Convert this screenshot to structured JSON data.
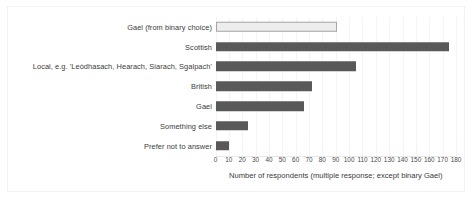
{
  "chart_data": {
    "type": "bar",
    "orientation": "horizontal",
    "title": "",
    "xlabel": "Number of respondents (multiple response; except binary Gael)",
    "ylabel": "",
    "xlim": [
      0,
      180
    ],
    "xticks": [
      0,
      10,
      20,
      30,
      40,
      50,
      60,
      70,
      80,
      90,
      100,
      110,
      120,
      130,
      140,
      150,
      160,
      170,
      180
    ],
    "grid": true,
    "legend": "none",
    "categories": [
      "Gael (from binary choice)",
      "Scottish",
      "Local, e.g. 'Leòdhasach, Hearach, Siarach, Sgalpach'",
      "British",
      "Gael",
      "Something else",
      "Prefer not to answer"
    ],
    "values": [
      91,
      175,
      105,
      72,
      66,
      24,
      10
    ],
    "bar_styles": [
      {
        "fill": "#ededed",
        "stroke": "#a6a6a6",
        "note": "binary choice bar, light fill with outline"
      },
      {
        "fill": "#595959",
        "stroke": "none"
      },
      {
        "fill": "#595959",
        "stroke": "none"
      },
      {
        "fill": "#595959",
        "stroke": "none"
      },
      {
        "fill": "#595959",
        "stroke": "none"
      },
      {
        "fill": "#595959",
        "stroke": "none"
      },
      {
        "fill": "#595959",
        "stroke": "none"
      }
    ],
    "colors": {
      "bar_dark": "#595959",
      "bar_light": "#ededed",
      "bar_light_border": "#a6a6a6",
      "gridline": "#f4f4f4",
      "axis": "#e8e8e8",
      "text": "#3a3a3a",
      "frame": "#f2f2f2",
      "background": "#ffffff"
    }
  }
}
